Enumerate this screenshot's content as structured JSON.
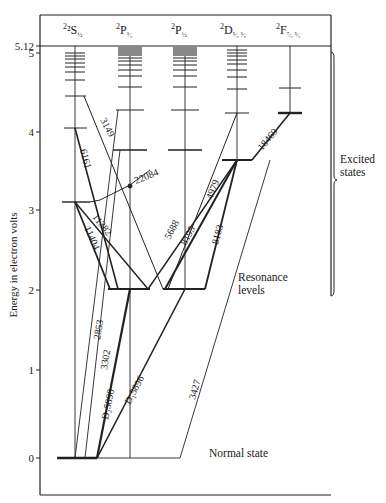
{
  "diagram": {
    "type": "energy-level (Grotrian) diagram",
    "element_hint": "sodium",
    "y_axis": {
      "label": "Energy in electron volts",
      "ticks": [
        "0",
        "1",
        "2",
        "3",
        "4",
        "5",
        "5.12"
      ]
    },
    "columns": [
      {
        "id": "S",
        "label_main": "²S",
        "label_sub": "½"
      },
      {
        "id": "P32",
        "label_main": "²P",
        "label_sub": "³⁄₂"
      },
      {
        "id": "P12",
        "label_main": "²P",
        "label_sub": "½"
      },
      {
        "id": "D",
        "label_main": "²D",
        "label_sub": "⁵⁄₂ ³⁄₂"
      },
      {
        "id": "F",
        "label_main": "²F",
        "label_sub": "⁷⁄₂ ⁵⁄₂"
      }
    ],
    "transitions": [
      {
        "label": "3149"
      },
      {
        "label": "6161"
      },
      {
        "label": "22084"
      },
      {
        "label": "11382"
      },
      {
        "label": "11404"
      },
      {
        "label": "5688"
      },
      {
        "label": "4979"
      },
      {
        "label": "8195"
      },
      {
        "label": "8183"
      },
      {
        "label": "18460"
      },
      {
        "label": "2853"
      },
      {
        "label": "3302"
      },
      {
        "label": "D₂5890"
      },
      {
        "label": "D₁5896"
      },
      {
        "label": "3427"
      }
    ],
    "annotations": {
      "excited": "Excited",
      "excited2": "states",
      "resonance": "Resonance",
      "resonance2": "levels",
      "normal": "Normal state"
    }
  }
}
